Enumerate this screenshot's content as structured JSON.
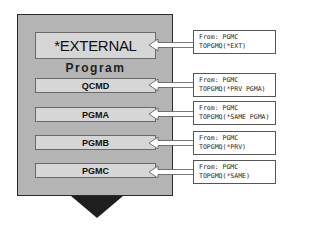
{
  "diagram": {
    "type": "call-stack",
    "container": {
      "top_entry": "*EXTERNAL",
      "section_label": "Program",
      "entries": [
        "QCMD",
        "PGMA",
        "PGMB",
        "PGMC"
      ]
    },
    "callouts": [
      {
        "target": "*EXTERNAL",
        "line1": "From: PGMC",
        "line2": "TOPGMQ(*EXT)"
      },
      {
        "target": "QCMD",
        "line1": "From: PGMC",
        "line2": "TOPGMQ(*PRV PGMA)"
      },
      {
        "target": "PGMA",
        "line1": "From: PGMC",
        "line2": "TOPGMQ(*SAME PGMA)"
      },
      {
        "target": "PGMB",
        "line1": "From: PGMC",
        "line2": "TOPGMQ(*PRV)"
      },
      {
        "target": "PGMC",
        "line1": "From: PGMC",
        "line2": "TOPGMQ(*SAME)"
      }
    ],
    "colors": {
      "container_fill": "#b4b4b4",
      "entry_fill": "#d6d6d6",
      "border": "#2a2a2a",
      "arrow_fill": "#ffffff",
      "triangle": "#1e1e1e"
    },
    "icons": [
      "left-arrow-icon",
      "down-triangle-icon"
    ]
  }
}
